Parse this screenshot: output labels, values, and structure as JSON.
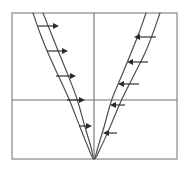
{
  "figure": {
    "background_color": "#ffffff",
    "frame_color": "#7d7d7d",
    "axis_color": "#6e6e6e",
    "curve_color": "#4a4a4a",
    "arrow_color": "#2b2b2b",
    "width": 190,
    "height": 170
  },
  "chart_data": {
    "type": "line",
    "title": "",
    "subtitle": "",
    "xlabel": "",
    "ylabel": "",
    "grid": true,
    "legend_position": "none",
    "annotations": [
      "Horizontal arrows on the left branch point right (toward the axis)",
      "Horizontal arrows on the right branch point left (toward the axis)",
      "Both parabolas share the same vertex at the origin on the bottom frame edge"
    ],
    "plot_box": {
      "left": 12,
      "top": 13,
      "right": 177,
      "bottom": 159
    },
    "axes": {
      "vertical_axis_x": 94,
      "horizontal_axis_y": 100,
      "xlim": [
        -1,
        1
      ],
      "ylim": [
        0,
        1
      ],
      "xticks": [],
      "yticks": []
    },
    "series": [
      {
        "name": "outer-parabola",
        "role": "wide",
        "vertex": [
          94,
          159
        ],
        "points_left": [
          [
            33,
            13
          ],
          [
            40,
            33
          ],
          [
            48,
            53
          ],
          [
            58,
            75
          ],
          [
            69,
            99
          ],
          [
            80,
            127
          ],
          [
            88,
            147
          ],
          [
            94,
            159
          ]
        ],
        "points_right": [
          [
            94,
            159
          ],
          [
            101,
            147
          ],
          [
            110,
            127
          ],
          [
            122,
            99
          ],
          [
            134,
            75
          ],
          [
            145,
            53
          ],
          [
            153,
            33
          ],
          [
            160,
            13
          ]
        ]
      },
      {
        "name": "inner-parabola",
        "role": "narrow",
        "vertex": [
          94,
          159
        ],
        "points_left": [
          [
            43,
            13
          ],
          [
            51,
            33
          ],
          [
            59,
            53
          ],
          [
            68,
            75
          ],
          [
            77,
            99
          ],
          [
            85,
            127
          ],
          [
            91,
            147
          ],
          [
            94,
            159
          ]
        ],
        "points_right": [
          [
            94,
            159
          ],
          [
            98,
            147
          ],
          [
            104,
            127
          ],
          [
            112,
            99
          ],
          [
            122,
            75
          ],
          [
            131,
            53
          ],
          [
            139,
            33
          ],
          [
            146,
            13
          ]
        ]
      }
    ],
    "arrows": [
      {
        "id": "left-1",
        "side": "left",
        "direction": "right",
        "x1": 38,
        "x2": 59,
        "y": 26
      },
      {
        "id": "left-2",
        "side": "left",
        "direction": "right",
        "x1": 47,
        "x2": 68,
        "y": 51
      },
      {
        "id": "left-3",
        "side": "left",
        "direction": "right",
        "x1": 56,
        "x2": 76,
        "y": 76
      },
      {
        "id": "left-4",
        "side": "left",
        "direction": "right",
        "x1": 67,
        "x2": 85,
        "y": 100
      },
      {
        "id": "left-5",
        "side": "left",
        "direction": "right",
        "x1": 79,
        "x2": 92,
        "y": 126
      },
      {
        "id": "right-1",
        "side": "right",
        "direction": "left",
        "x1": 156,
        "x2": 134,
        "y": 37
      },
      {
        "id": "right-2",
        "side": "right",
        "direction": "left",
        "x1": 148,
        "x2": 127,
        "y": 62
      },
      {
        "id": "right-3",
        "side": "right",
        "direction": "left",
        "x1": 139,
        "x2": 118,
        "y": 84
      },
      {
        "id": "right-4",
        "side": "right",
        "direction": "left",
        "x1": 125,
        "x2": 110,
        "y": 105
      },
      {
        "id": "right-5",
        "side": "right",
        "direction": "left",
        "x1": 117,
        "x2": 103,
        "y": 133
      }
    ]
  }
}
